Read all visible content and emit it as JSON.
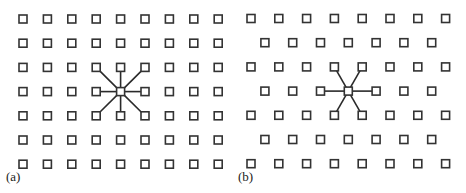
{
  "figure": {
    "stroke_color": "#333333",
    "line_color": "#2a2a2a",
    "node_size": 8
  },
  "panels": [
    {
      "id": "a",
      "label": "(a)",
      "lattice": "square",
      "rows": 7,
      "cols": 9,
      "origin": [
        23,
        19
      ],
      "dx": 24.4,
      "dy": 24.2,
      "center_node": {
        "row": 3,
        "col": 4
      },
      "neighbor_count": 8,
      "label_pos": [
        6,
        181
      ]
    },
    {
      "id": "b",
      "label": "(b)",
      "lattice": "hexagonal (offset rows)",
      "rows": 7,
      "cols_long_row": 8,
      "cols_short_row": 7,
      "origin": [
        251,
        18.5
      ],
      "dx": 27.8,
      "dy": 24.2,
      "short_row_offset": 13.9,
      "center_node": {
        "row": 3,
        "col": 3
      },
      "neighbor_count": 6,
      "label_pos": [
        238,
        181
      ]
    }
  ]
}
